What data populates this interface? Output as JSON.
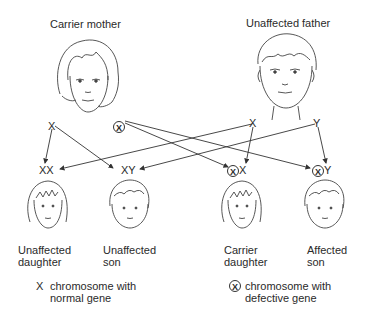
{
  "parents": {
    "mother": {
      "label": "Carrier mother",
      "chrom_left": "X",
      "chrom_right": "X"
    },
    "father": {
      "label": "Unaffected father",
      "chrom_left": "X",
      "chrom_right": "Y"
    }
  },
  "children": [
    {
      "label_line1": "Unaffected",
      "label_line2": "daughter",
      "genotype": "XX",
      "defective": false
    },
    {
      "label_line1": "Unaffected",
      "label_line2": "son",
      "genotype": "XY",
      "defective": false
    },
    {
      "label_line1": "Carrier",
      "label_line2": "daughter",
      "genotype_circled": "X",
      "genotype_rest": "X",
      "defective": true
    },
    {
      "label_line1": "Affected",
      "label_line2": "son",
      "genotype_circled": "X",
      "genotype_rest": "Y",
      "defective": true
    }
  ],
  "legend": {
    "normal": {
      "symbol": "X",
      "line1": "chromosome with",
      "line2": "normal gene"
    },
    "defective": {
      "symbol": "X",
      "line1": "chromosome with",
      "line2": "defective gene"
    }
  },
  "colors": {
    "ink": "#2a2a2a",
    "background": "#ffffff"
  }
}
